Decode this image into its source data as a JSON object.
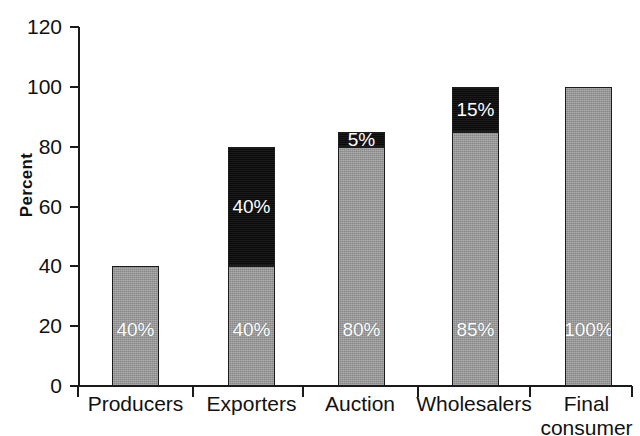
{
  "chart_data": {
    "type": "bar",
    "title": "",
    "subtitle": "",
    "xlabel": "",
    "ylabel": "Percent",
    "ylim": [
      0,
      120
    ],
    "yticks": [
      0,
      20,
      40,
      60,
      80,
      100,
      120
    ],
    "ytick_labels": [
      "0",
      "20",
      "40",
      "60",
      "80",
      "100",
      "120"
    ],
    "grid": false,
    "legend": "none",
    "stacked": true,
    "categories": [
      "Producers",
      "Exporters",
      "Auction",
      "Wholesalers",
      "Final consumer"
    ],
    "series": [
      {
        "name": "gray",
        "color": "#9b9b9b",
        "values": [
          40,
          40,
          80,
          85,
          100
        ]
      },
      {
        "name": "black",
        "color": "#0e0e0e",
        "values": [
          0,
          40,
          5,
          15,
          0
        ]
      }
    ],
    "totals": [
      40,
      80,
      85,
      100,
      100
    ],
    "bars": [
      {
        "category": "Producers",
        "category_lines": [
          "Producers"
        ],
        "total": 40,
        "segments": [
          {
            "series": "gray",
            "value": 40,
            "label": "40%",
            "color": "#9b9b9b"
          }
        ]
      },
      {
        "category": "Exporters",
        "category_lines": [
          "Exporters"
        ],
        "total": 80,
        "segments": [
          {
            "series": "gray",
            "value": 40,
            "label": "40%",
            "color": "#9b9b9b"
          },
          {
            "series": "black",
            "value": 40,
            "label": "40%",
            "color": "#0e0e0e"
          }
        ]
      },
      {
        "category": "Auction",
        "category_lines": [
          "Auction"
        ],
        "total": 85,
        "segments": [
          {
            "series": "gray",
            "value": 80,
            "label": "80%",
            "color": "#9b9b9b"
          },
          {
            "series": "black",
            "value": 5,
            "label": "5%",
            "color": "#0e0e0e"
          }
        ]
      },
      {
        "category": "Wholesalers",
        "category_lines": [
          "Wholesalers"
        ],
        "total": 100,
        "segments": [
          {
            "series": "gray",
            "value": 85,
            "label": "85%",
            "color": "#9b9b9b"
          },
          {
            "series": "black",
            "value": 15,
            "label": "15%",
            "color": "#0e0e0e"
          }
        ]
      },
      {
        "category": "Final consumer",
        "category_lines": [
          "Final",
          "consumer"
        ],
        "total": 100,
        "segments": [
          {
            "series": "gray",
            "value": 100,
            "label": "100%",
            "color": "#9b9b9b"
          }
        ]
      }
    ]
  },
  "axis": {
    "y_title": "Percent",
    "y_tick_labels": [
      "120",
      "100",
      "80",
      "60",
      "40",
      "20",
      "0"
    ],
    "x_tick_labels": [
      "Producers",
      "Exporters",
      "Auction",
      "Wholesalers",
      "Final\nconsumer"
    ]
  }
}
